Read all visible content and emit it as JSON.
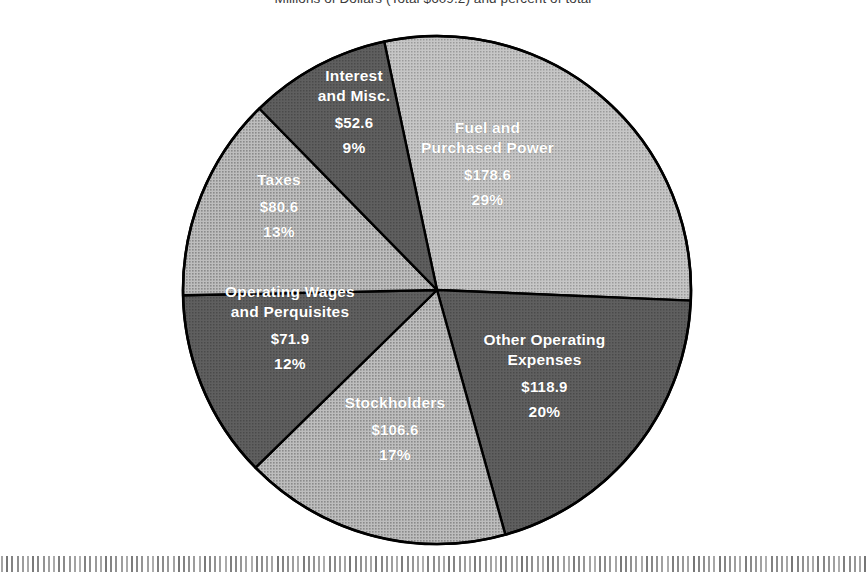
{
  "title": "Millions of Dollars (Total $609.2) and percent of total",
  "chart_data": {
    "type": "pie",
    "title": "Millions of Dollars (Total $609.2) and percent of total",
    "total": 609.2,
    "units": "Millions of Dollars",
    "legend": "none",
    "labels_inside_slices": true,
    "categories": [
      "Fuel and Purchased Power",
      "Other Operating Expenses",
      "Stockholders",
      "Operating Wages and Perquisites",
      "Taxes",
      "Interest and Misc."
    ],
    "values": [
      178.6,
      118.9,
      106.6,
      71.9,
      80.6,
      52.6
    ],
    "percentages": [
      29,
      20,
      17,
      12,
      13,
      9
    ],
    "start_angle_deg": -12,
    "direction": "clockwise",
    "slices": [
      {
        "name": "Fuel and Purchased Power",
        "label_line1": "Fuel and",
        "label_line2": "Purchased Power",
        "value": 178.6,
        "value_text": "$178.6",
        "percent": 29,
        "percent_text": "29%",
        "color": "#b4b4b4",
        "text_color": "#ffffff"
      },
      {
        "name": "Other Operating Expenses",
        "label_line1": "Other Operating",
        "label_line2": "Expenses",
        "value": 118.9,
        "value_text": "$118.9",
        "percent": 20,
        "percent_text": "20%",
        "color": "#585858",
        "text_color": "#ffffff"
      },
      {
        "name": "Stockholders",
        "label_line1": "Stockholders",
        "label_line2": "",
        "value": 106.6,
        "value_text": "$106.6",
        "percent": 17,
        "percent_text": "17%",
        "color": "#a9a9a9",
        "text_color": "#ffffff"
      },
      {
        "name": "Operating Wages and Perquisites",
        "label_line1": "Operating Wages",
        "label_line2": "and Perquisites",
        "value": 71.9,
        "value_text": "$71.9",
        "percent": 12,
        "percent_text": "12%",
        "color": "#525252",
        "text_color": "#ffffff"
      },
      {
        "name": "Taxes",
        "label_line1": "Taxes",
        "label_line2": "",
        "value": 80.6,
        "value_text": "$80.6",
        "percent": 13,
        "percent_text": "13%",
        "color": "#9e9e9e",
        "text_color": "#ffffff"
      },
      {
        "name": "Interest and Misc.",
        "label_line1": "Interest",
        "label_line2": "and  Misc.",
        "value": 52.6,
        "value_text": "$52.6",
        "percent": 9,
        "percent_text": "9%",
        "color": "#4e4e4e",
        "text_color": "#ffffff"
      }
    ],
    "geometry": {
      "center_x": 437,
      "center_y": 290,
      "radius": 254
    },
    "background_color": "#ffffff",
    "outline_color": "#000000"
  }
}
